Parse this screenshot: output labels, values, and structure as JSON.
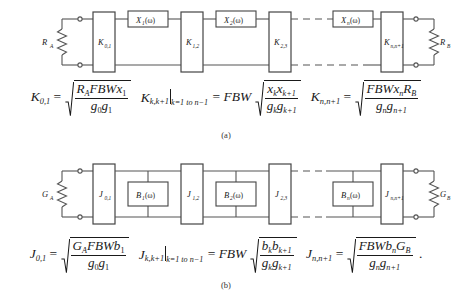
{
  "figure": {
    "panels": [
      {
        "id": "a",
        "caption": "(a)",
        "type": "impedance-inverter-bandpass-prototype",
        "source_label": "R",
        "source_sub": "A",
        "load_label": "R",
        "load_sub": "B",
        "inverters": [
          {
            "symbol": "K",
            "sub": "0,1"
          },
          {
            "symbol": "K",
            "sub": "1,2"
          },
          {
            "symbol": "K",
            "sub": "2,3"
          },
          {
            "symbol": "K",
            "sub": "n,n+1"
          }
        ],
        "resonators": [
          {
            "symbol": "X",
            "sub": "1",
            "arg": "(ω)"
          },
          {
            "symbol": "X",
            "sub": "2",
            "arg": "(ω)"
          },
          {
            "symbol": "X",
            "sub": "n",
            "arg": "(ω)"
          }
        ],
        "equations": [
          {
            "lhs": "K",
            "lhs_sub": "0,1",
            "rel": "=",
            "radical": true,
            "num": "R_A FBW x_1",
            "den": "g_0 g_1",
            "prefix": ""
          },
          {
            "lhs": "K",
            "lhs_sub": "k,k+1",
            "eval": "k=1 to n−1",
            "rel": "=",
            "prefix": "FBW",
            "radical": true,
            "num": "x_k x_k+1",
            "den": "g_k g_k+1"
          },
          {
            "lhs": "K",
            "lhs_sub": "n,n+1",
            "rel": "=",
            "radical": true,
            "num": "FBW x_n R_B",
            "den": "g_n g_n+1"
          }
        ]
      },
      {
        "id": "b",
        "caption": "(b)",
        "type": "admittance-inverter-bandpass-prototype",
        "source_label": "G",
        "source_sub": "A",
        "load_label": "G",
        "load_sub": "B",
        "inverters": [
          {
            "symbol": "J",
            "sub": "0,1"
          },
          {
            "symbol": "J",
            "sub": "1,2"
          },
          {
            "symbol": "J",
            "sub": "2,3"
          },
          {
            "symbol": "J",
            "sub": "n,n+1"
          }
        ],
        "resonators": [
          {
            "symbol": "B",
            "sub": "1",
            "arg": "(ω)"
          },
          {
            "symbol": "B",
            "sub": "2",
            "arg": "(ω)"
          },
          {
            "symbol": "B",
            "sub": "n",
            "arg": "(ω)"
          }
        ],
        "equations": [
          {
            "lhs": "J",
            "lhs_sub": "0,1",
            "rel": "=",
            "radical": true,
            "num": "G_A FBW b_1",
            "den": "g_0 g_1"
          },
          {
            "lhs": "J",
            "lhs_sub": "k,k+1",
            "eval": "k=1 to n−1",
            "rel": "=",
            "prefix": "FBW",
            "radical": true,
            "num": "b_k b_k+1",
            "den": "g_k g_k+1"
          },
          {
            "lhs": "J",
            "lhs_sub": "n,n+1",
            "rel": "=",
            "radical": true,
            "num": "FBW b_n G_B",
            "den": "g_n g_n+1",
            "trailing": "."
          }
        ]
      }
    ],
    "text": {
      "omega": "ω",
      "fbw": "FBW",
      "eval_range": "k=1 to n−1",
      "eval_k": "k",
      "eval_eq": "=1",
      "eval_to": "to",
      "eval_n1": "n−1",
      "period": ".",
      "equals": "=",
      "lparen": "(",
      "rparen": ")",
      "g": "g",
      "x": "x",
      "b": "b",
      "R": "R",
      "G": "G",
      "K": "K",
      "J": "J",
      "X": "X",
      "B": "B",
      "sub_A": "A",
      "sub_B": "B",
      "sub_0": "0",
      "sub_1": "1",
      "sub_2": "2",
      "sub_n": "n",
      "sub_k": "k",
      "sub_k1": "k+1",
      "sub_n1": "n+1",
      "sub_01": "0,1",
      "sub_12": "1,2",
      "sub_23": "2,3",
      "sub_nn1": "n,n+1",
      "sub_kk1": "k,k+1"
    }
  },
  "colors": {
    "wire": "#555555",
    "box_stroke": "#444444",
    "text": "#1a1a1a",
    "background": "#ffffff"
  }
}
